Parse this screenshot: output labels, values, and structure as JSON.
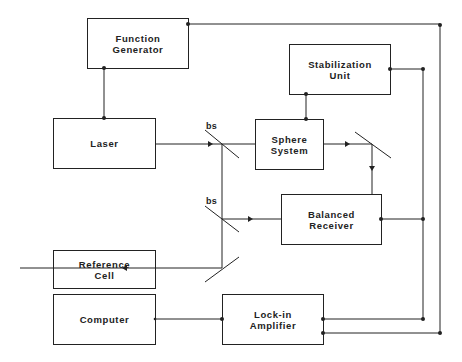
{
  "blocks": {
    "function_generator": "Function\nGenerator",
    "stabilization_unit": "Stabilization\nUnit",
    "laser": "Laser",
    "sphere_system": "Sphere\nSystem",
    "balanced_receiver": "Balanced\nReceiver",
    "reference_cell": "Reference\nCell",
    "computer": "Computer",
    "lockin_amplifier": "Lock-in\nAmplifier"
  },
  "labels": {
    "bs_upper": "bs",
    "bs_lower": "bs"
  },
  "colors": {
    "line": "#222222",
    "background": "#ffffff"
  }
}
